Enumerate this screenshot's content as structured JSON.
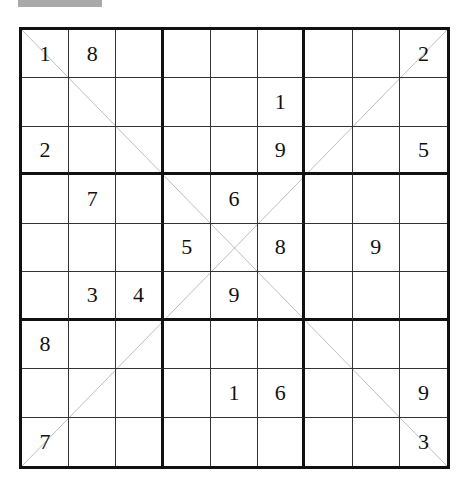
{
  "header": {
    "label": ""
  },
  "puzzle": {
    "type": "diagonal-sudoku",
    "size": 9,
    "diagonals": [
      "main",
      "anti"
    ],
    "grid": [
      [
        "1",
        "8",
        "",
        "",
        "",
        "",
        "",
        "",
        "2"
      ],
      [
        "",
        "",
        "",
        "",
        "",
        "1",
        "",
        "",
        ""
      ],
      [
        "2",
        "",
        "",
        "",
        "",
        "9",
        "",
        "",
        "5"
      ],
      [
        "",
        "7",
        "",
        "",
        "6",
        "",
        "",
        "",
        ""
      ],
      [
        "",
        "",
        "",
        "5",
        "",
        "8",
        "",
        "9",
        ""
      ],
      [
        "",
        "3",
        "4",
        "",
        "9",
        "",
        "",
        "",
        ""
      ],
      [
        "8",
        "",
        "",
        "",
        "",
        "",
        "",
        "",
        ""
      ],
      [
        "",
        "",
        "",
        "",
        "1",
        "6",
        "",
        "",
        "9"
      ],
      [
        "7",
        "",
        "",
        "",
        "",
        "",
        "",
        "",
        "3"
      ]
    ]
  },
  "colors": {
    "line": "#111111",
    "thin_line": "#333333",
    "background": "#ffffff",
    "header_bar": "#a9a9a9"
  }
}
